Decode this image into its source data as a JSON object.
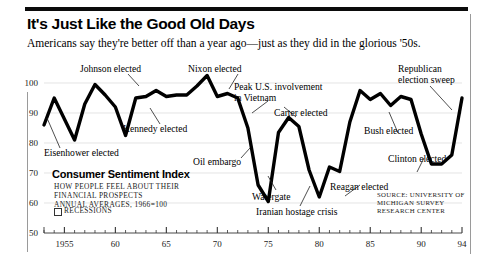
{
  "headline": "It's Just Like the Good Old Days",
  "subhead": "Americans say they're better off than a year ago—just as they did in the glorious '50s.",
  "legend": {
    "title": "Consumer Sentiment Index",
    "desc_line1": "How people feel about their",
    "desc_line2": "financial prospects",
    "desc_line3": "Annual averages, 1966=100",
    "recessions_label": "Recessions"
  },
  "source": "Source: University of Michigan Survey Research Center",
  "chart_data": {
    "type": "line",
    "title": "Consumer Sentiment Index",
    "xlabel": "",
    "ylabel": "Consumer Sentiment Index",
    "xlim": [
      1953,
      1994
    ],
    "ylim": [
      50,
      100
    ],
    "ytick_values": [
      50,
      60,
      70,
      80,
      90,
      100
    ],
    "ytick_labels": [
      "50",
      "60",
      "70",
      "80",
      "90",
      "100"
    ],
    "xtick_values": [
      1955,
      1960,
      1965,
      1970,
      1975,
      1980,
      1985,
      1990,
      1994
    ],
    "xtick_labels": [
      "1955",
      "60",
      "65",
      "70",
      "75",
      "80",
      "85",
      "90",
      "94"
    ],
    "minor_xticks_every": 1,
    "grid": "horizontal-light",
    "legend_position": "none",
    "series": [
      {
        "name": "Consumer Sentiment Index",
        "x": [
          1953,
          1954,
          1955,
          1956,
          1957,
          1958,
          1959,
          1960,
          1961,
          1962,
          1963,
          1964,
          1965,
          1966,
          1967,
          1968,
          1969,
          1970,
          1971,
          1972,
          1973,
          1974,
          1975,
          1976,
          1977,
          1978,
          1979,
          1980,
          1981,
          1982,
          1983,
          1984,
          1985,
          1986,
          1987,
          1988,
          1989,
          1990,
          1991,
          1992,
          1993,
          1994
        ],
        "values": [
          86,
          95,
          88,
          81,
          93,
          99.5,
          96,
          92,
          82.5,
          95,
          95.5,
          97.5,
          95.5,
          96,
          96,
          99,
          102.5,
          95.5,
          96.5,
          95,
          85,
          66,
          60.5,
          83.5,
          88.5,
          85.5,
          71,
          62,
          72,
          70.5,
          87,
          97.5,
          94.5,
          96.5,
          92.5,
          95.5,
          94.5,
          83,
          73,
          73,
          76,
          95
        ]
      }
    ],
    "annotations": [
      {
        "label": "Eisenhower elected",
        "year": 1953
      },
      {
        "label": "Johnson elected",
        "year": 1964
      },
      {
        "label": "Kennedy elected",
        "year": 1960
      },
      {
        "label": "Nixon elected",
        "year": 1968
      },
      {
        "label": "Peak U.S. involvement in Vietnam",
        "year": 1969
      },
      {
        "label": "Oil embargo",
        "year": 1974
      },
      {
        "label": "Watergate",
        "year": 1974
      },
      {
        "label": "Carter elected",
        "year": 1976
      },
      {
        "label": "Iranian hostage crisis",
        "year": 1980
      },
      {
        "label": "Reagan elected",
        "year": 1980
      },
      {
        "label": "Bush elected",
        "year": 1988
      },
      {
        "label": "Clinton elected",
        "year": 1992
      },
      {
        "label": "Republican election sweep",
        "year": 1994
      }
    ]
  },
  "annotation_text": {
    "eisenhower": "Eisenhower elected",
    "johnson": "Johnson elected",
    "kennedy": "Kennedy elected",
    "nixon": "Nixon elected",
    "vietnam_l1": "Peak U.S. involvement",
    "vietnam_l2": "in Vietnam",
    "oil": "Oil embargo",
    "watergate": "Watergate",
    "carter": "Carter elected",
    "iran": "Iranian hostage crisis",
    "reagan": "Reagan elected",
    "bush": "Bush elected",
    "clinton": "Clinton elected",
    "gop_l1": "Republican",
    "gop_l2": "election sweep"
  }
}
